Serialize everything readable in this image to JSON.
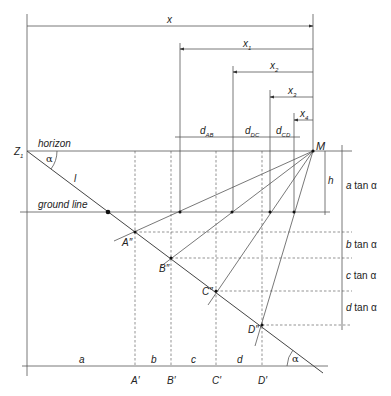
{
  "figure": {
    "dimensions": {
      "x": "x",
      "x1": {
        "base": "x",
        "sub": "1"
      },
      "x2": {
        "base": "x",
        "sub": "2"
      },
      "x3": {
        "base": "x",
        "sub": "3"
      },
      "x4": {
        "base": "x",
        "sub": "4"
      }
    },
    "distances": {
      "dAB": {
        "base": "d",
        "sub": "AB"
      },
      "dDC": {
        "base": "d",
        "sub": "DC"
      },
      "dCD": {
        "base": "d",
        "sub": "CD"
      }
    },
    "lines": {
      "horizon": "horizon",
      "ground_line": "ground line",
      "l": "l"
    },
    "points": {
      "Z1": {
        "base": "Z",
        "sub": "1"
      },
      "M": "M",
      "A2": "A″",
      "B2": "B″",
      "C2": "C″",
      "D2": "D″",
      "A1": "A′",
      "B1": "B′",
      "C1": "C′",
      "D1": "D′"
    },
    "segments": {
      "a": "a",
      "b": "b",
      "c": "c",
      "d": "d"
    },
    "heights": {
      "h": "h",
      "a_tan": {
        "var": "a",
        "rest": " tan α"
      },
      "b_tan": {
        "var": "b",
        "rest": " tan α"
      },
      "c_tan": {
        "var": "c",
        "rest": " tan α"
      },
      "d_tan": {
        "var": "d",
        "rest": " tan α"
      }
    },
    "angle": "α"
  }
}
